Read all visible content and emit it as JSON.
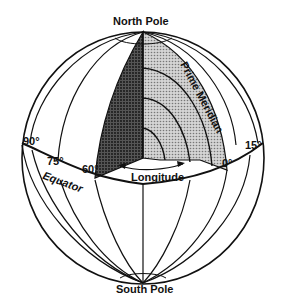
{
  "diagram": {
    "labels": {
      "north_pole": "North Pole",
      "south_pole": "South Pole",
      "prime_meridian": "Prime Meridian",
      "equator": "Equator",
      "longitude": "Longitude"
    },
    "degrees": {
      "d90": "90°",
      "d75": "75°",
      "d60": "60°",
      "d0": "0°",
      "d15": "15°"
    },
    "colors": {
      "line": "#111111",
      "dark_wedge": "#3a3a3a",
      "light_wedge": "#b8b8b8",
      "background": "#ffffff"
    }
  }
}
